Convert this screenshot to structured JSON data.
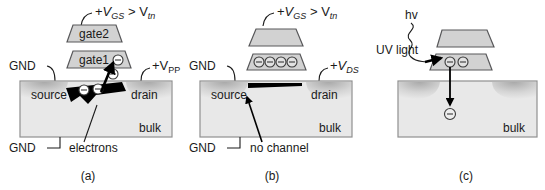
{
  "figure": {
    "colors": {
      "ink": "#1a1a1a",
      "gate_fill": "#d2d2d2",
      "gate_stroke": "#58585a",
      "bulk_fill": "#e8e8e8",
      "bulk_stroke": "#9a9a9a",
      "diffusion_dark": "#b4b4b4",
      "channel_black": "#000000",
      "background": "#ffffff"
    }
  },
  "panels": [
    {
      "id": "a",
      "caption": "(a)",
      "gate_top_label": "gate2",
      "gate_bottom_label": "gate1",
      "bias_label": {
        "prefix": "+",
        "v1": "V",
        "v1_sub": "GS",
        "relation": ">",
        "v2": "V",
        "v2_sub": "tn"
      },
      "terminal_left_top": "GND",
      "terminal_left_bottom": "GND",
      "terminal_right": {
        "prefix": "+",
        "v": "V",
        "sub": "PP"
      },
      "region_source": "source",
      "region_drain": "drain",
      "region_bulk": "bulk",
      "annotation": "electrons",
      "electron_count_channel": 2,
      "electron_count_gate": 1,
      "electron_count_injecting": 1,
      "electron_symbol": "minus-circle"
    },
    {
      "id": "b",
      "caption": "(b)",
      "gate_top_label": "",
      "gate_bottom_label": "",
      "bias_label": {
        "prefix": "+",
        "v1": "V",
        "v1_sub": "GS",
        "relation": ">",
        "v2": "V",
        "v2_sub": "tn"
      },
      "terminal_left_top": "GND",
      "terminal_left_bottom": "GND",
      "terminal_right": {
        "prefix": "+",
        "v": "V",
        "sub": "DS"
      },
      "region_source": "source",
      "region_drain": "drain",
      "region_bulk": "bulk",
      "annotation": "no channel",
      "electron_count_gate": 4,
      "electron_symbol": "minus-circle"
    },
    {
      "id": "c",
      "caption": "(c)",
      "photon_label": "hv",
      "light_label": "UV light",
      "region_bulk": "bulk",
      "electron_count_gate": 2,
      "electron_count_escaping": 1,
      "electron_symbol": "minus-circle"
    }
  ]
}
